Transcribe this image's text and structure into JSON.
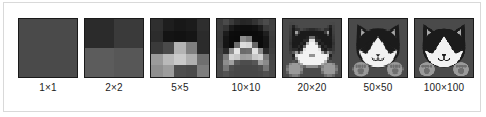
{
  "figure": {
    "caption_alt": "Cat image shown at increasing pixel resolutions",
    "background_color": "#ffffff",
    "frame_border_color": "#d9d9d9",
    "label_color": "#1c1c1c",
    "tile_border_color": "#1a1a1a"
  },
  "palette": {
    "black": "#1b1b1b",
    "dark_gray": "#333333",
    "body_gray": "#4a4a4a",
    "mid_gray": "#6e6e6e",
    "light_gray": "#a8a8a8",
    "paw_gray": "#9a9a9a",
    "white": "#f2f2f2",
    "off_white": "#e3e3e3"
  },
  "tiles": [
    {
      "id": "tile-1x1",
      "label": "1×1",
      "resolution": 1,
      "width": 1,
      "height": 1,
      "pixels": [
        "#4a4a4a"
      ]
    },
    {
      "id": "tile-2x2",
      "label": "2×2",
      "resolution": 2,
      "width": 2,
      "height": 2,
      "pixels": [
        "#2b2b2b",
        "#3a3a3a",
        "#5c5c5c",
        "#575757"
      ]
    },
    {
      "id": "tile-5x5",
      "label": "5×5",
      "resolution": 5,
      "width": 5,
      "height": 5,
      "pixels": [
        "#2f2f2f",
        "#1e1e1e",
        "#181818",
        "#1b1b1b",
        "#2e2e2e",
        "#2c2c2c",
        "#141414",
        "#121212",
        "#151515",
        "#2b2b2b",
        "#3a3a3a",
        "#4a4a4a",
        "#b4b4b4",
        "#7f7f7f",
        "#2b2b2b",
        "#9b9b9b",
        "#b9b9b9",
        "#cacaca",
        "#b0b0b0",
        "#6f6f6f",
        "#8f8f8f",
        "#9d9d9d",
        "#4e4e4e",
        "#4a4a4a",
        "#7d7d7d"
      ]
    },
    {
      "id": "tile-10x10",
      "label": "10×10",
      "resolution": 10,
      "width": 10,
      "height": 10,
      "pixels": [
        "#3d3d3d",
        "#4a4a4a",
        "#3b3b3b",
        "#2c2c2c",
        "#262626",
        "#282828",
        "#333333",
        "#414141",
        "#4c4c4c",
        "#404040",
        "#3e3e3e",
        "#343434",
        "#1a1a1a",
        "#101010",
        "#0e0e0e",
        "#0e0e0e",
        "#111111",
        "#1d1d1d",
        "#3a3a3a",
        "#414141",
        "#3c3c3c",
        "#1c1c1c",
        "#0c0c0c",
        "#0b0b0b",
        "#0a0a0a",
        "#0a0a0a",
        "#0b0b0b",
        "#0d0d0d",
        "#1f1f1f",
        "#3e3e3e",
        "#3b3b3b",
        "#151515",
        "#0b0b0b",
        "#0a0a0a",
        "#8e8e8e",
        "#7b7b7b",
        "#0c0c0c",
        "#0b0b0b",
        "#161616",
        "#3c3c3c",
        "#3d3d3d",
        "#141414",
        "#0b0b0b",
        "#6d6d6d",
        "#dcdcdc",
        "#d6d6d6",
        "#666666",
        "#0b0b0b",
        "#151515",
        "#3d3d3d",
        "#424242",
        "#2a2a2a",
        "#8f8f8f",
        "#e6e6e6",
        "#6a6a6a",
        "#6e6e6e",
        "#e2e2e2",
        "#8b8b8b",
        "#292929",
        "#404040",
        "#464646",
        "#7c7c7c",
        "#d3d3d3",
        "#c9c9c9",
        "#9e9e9e",
        "#a2a2a2",
        "#c7c7c7",
        "#d1d1d1",
        "#787878",
        "#444444",
        "#4a4a4a",
        "#8d8d8d",
        "#a0a0a0",
        "#585858",
        "#4d4d4d",
        "#4d4d4d",
        "#565656",
        "#9e9e9e",
        "#8a8a8a",
        "#474747",
        "#4b4b4b",
        "#777777",
        "#4f4f4f",
        "#484848",
        "#474747",
        "#474747",
        "#484848",
        "#4e4e4e",
        "#757575",
        "#484848",
        "#4a4a4a",
        "#535353",
        "#4a4a4a",
        "#474747",
        "#474747",
        "#474747",
        "#474747",
        "#494949",
        "#505050",
        "#494949"
      ]
    },
    {
      "id": "tile-20x20",
      "label": "20×20",
      "resolution": 20,
      "width": 20,
      "height": 20,
      "pixels": null
    },
    {
      "id": "tile-50x50",
      "label": "50×50",
      "resolution": 50,
      "width": 50,
      "height": 50,
      "pixels": null
    },
    {
      "id": "tile-100x100",
      "label": "100×100",
      "resolution": 100,
      "width": 100,
      "height": 100,
      "pixels": null
    }
  ]
}
